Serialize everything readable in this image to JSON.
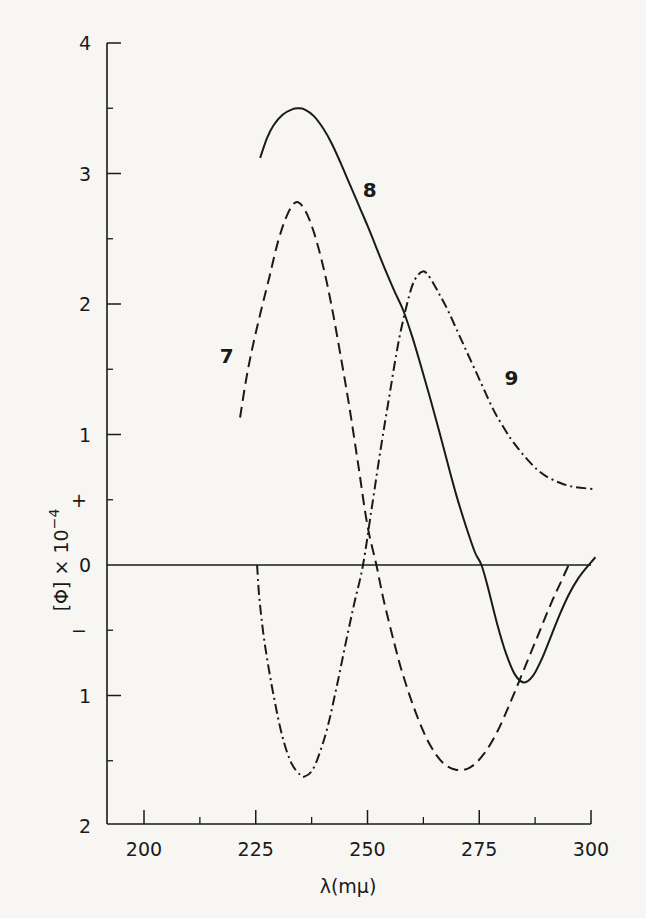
{
  "chart_data": {
    "type": "line",
    "title": "",
    "xlabel": "λ(mμ)",
    "ylabel": "[Φ] × 10⁻⁴",
    "ylabel_parts": {
      "main": "[Φ]  ×  10",
      "exp": "−4"
    },
    "xlim": [
      191.5,
      301
    ],
    "ylim": [
      -2,
      4
    ],
    "x_ticks": [
      200,
      225,
      250,
      275,
      300
    ],
    "x_tick_labels": [
      "200",
      "225",
      "250",
      "275",
      "300"
    ],
    "x_minor_ticks": [
      212.5,
      237.5,
      262.5,
      287.5
    ],
    "y_ticks": [
      4,
      3,
      2,
      1,
      0,
      -1,
      -2
    ],
    "y_tick_labels": [
      "4",
      "3",
      "2",
      "1",
      "0",
      "1",
      "2"
    ],
    "y_minor_ticks": [
      3.5,
      2.5,
      1.5,
      0.5,
      -0.5,
      -1.5
    ],
    "y_sign_marks": {
      "plus": "+",
      "minus": "−"
    },
    "grid": false,
    "legend": "inline curve labels",
    "zero_line": true,
    "series": [
      {
        "name": "7",
        "style": "dashed",
        "label_pos": [
          218.5,
          1.6
        ],
        "points": [
          [
            221.5,
            1.13
          ],
          [
            223,
            1.45
          ],
          [
            225,
            1.78
          ],
          [
            228,
            2.2
          ],
          [
            230,
            2.48
          ],
          [
            232,
            2.68
          ],
          [
            234,
            2.78
          ],
          [
            236,
            2.72
          ],
          [
            238,
            2.55
          ],
          [
            240,
            2.3
          ],
          [
            242,
            1.98
          ],
          [
            244,
            1.6
          ],
          [
            246,
            1.2
          ],
          [
            248,
            0.75
          ],
          [
            250,
            0.3
          ],
          [
            252,
            0
          ],
          [
            253.5,
            -0.25
          ],
          [
            256,
            -0.6
          ],
          [
            258,
            -0.85
          ],
          [
            261,
            -1.15
          ],
          [
            264,
            -1.38
          ],
          [
            267,
            -1.52
          ],
          [
            270,
            -1.57
          ],
          [
            273,
            -1.55
          ],
          [
            276,
            -1.45
          ],
          [
            279,
            -1.28
          ],
          [
            282,
            -1.05
          ],
          [
            285,
            -0.8
          ],
          [
            288,
            -0.55
          ],
          [
            291,
            -0.3
          ],
          [
            293,
            -0.15
          ],
          [
            295,
            0
          ]
        ]
      },
      {
        "name": "8",
        "style": "solid",
        "label_pos": [
          250.5,
          2.87
        ],
        "points": [
          [
            226,
            3.12
          ],
          [
            227.5,
            3.27
          ],
          [
            229,
            3.37
          ],
          [
            231,
            3.45
          ],
          [
            233,
            3.49
          ],
          [
            234.5,
            3.5
          ],
          [
            236,
            3.49
          ],
          [
            238,
            3.44
          ],
          [
            240,
            3.35
          ],
          [
            242,
            3.23
          ],
          [
            244,
            3.08
          ],
          [
            246,
            2.92
          ],
          [
            248,
            2.76
          ],
          [
            250,
            2.6
          ],
          [
            252,
            2.43
          ],
          [
            254,
            2.26
          ],
          [
            256,
            2.1
          ],
          [
            258,
            1.95
          ],
          [
            260,
            1.75
          ],
          [
            262,
            1.52
          ],
          [
            264,
            1.28
          ],
          [
            266,
            1.03
          ],
          [
            268,
            0.77
          ],
          [
            270,
            0.52
          ],
          [
            272,
            0.3
          ],
          [
            274,
            0.1
          ],
          [
            275.5,
            0
          ],
          [
            277,
            -0.18
          ],
          [
            279,
            -0.45
          ],
          [
            281,
            -0.68
          ],
          [
            283,
            -0.84
          ],
          [
            285,
            -0.9
          ],
          [
            287,
            -0.85
          ],
          [
            289,
            -0.72
          ],
          [
            291,
            -0.55
          ],
          [
            293,
            -0.38
          ],
          [
            295,
            -0.23
          ],
          [
            297,
            -0.11
          ],
          [
            299,
            -0.02
          ],
          [
            300,
            0.02
          ],
          [
            301,
            0.06
          ]
        ]
      },
      {
        "name": "9",
        "style": "dashdot",
        "label_pos": [
          282.2,
          1.43
        ],
        "points": [
          [
            225.3,
            0
          ],
          [
            225.8,
            -0.25
          ],
          [
            227,
            -0.6
          ],
          [
            229,
            -1.0
          ],
          [
            231,
            -1.32
          ],
          [
            233,
            -1.52
          ],
          [
            235,
            -1.61
          ],
          [
            236,
            -1.62
          ],
          [
            237.5,
            -1.58
          ],
          [
            239,
            -1.47
          ],
          [
            241,
            -1.25
          ],
          [
            243,
            -0.95
          ],
          [
            245,
            -0.62
          ],
          [
            247,
            -0.3
          ],
          [
            249,
            0
          ],
          [
            251,
            0.45
          ],
          [
            253,
            0.9
          ],
          [
            255,
            1.32
          ],
          [
            257,
            1.72
          ],
          [
            259,
            2.02
          ],
          [
            260.5,
            2.18
          ],
          [
            262.4,
            2.25
          ],
          [
            264,
            2.2
          ],
          [
            266,
            2.08
          ],
          [
            268,
            1.95
          ],
          [
            270,
            1.8
          ],
          [
            272,
            1.65
          ],
          [
            274,
            1.5
          ],
          [
            276,
            1.35
          ],
          [
            278,
            1.2
          ],
          [
            280,
            1.08
          ],
          [
            282,
            0.97
          ],
          [
            284,
            0.88
          ],
          [
            286,
            0.8
          ],
          [
            288,
            0.73
          ],
          [
            290,
            0.68
          ],
          [
            293,
            0.63
          ],
          [
            296,
            0.6
          ],
          [
            301,
            0.58
          ]
        ]
      }
    ]
  },
  "plot_area": {
    "px_x0": 144,
    "nm_x0": 200,
    "px_per_nm": 4.47,
    "px_y0": 565,
    "px_per_unit": 130.5,
    "axis_left_px": 107,
    "axis_bottom_px": 824,
    "axis_top_px": 43,
    "axis_right_px": 591
  },
  "colors": {
    "ink": "#1a1a1a",
    "paper": "#f7f6f3"
  }
}
